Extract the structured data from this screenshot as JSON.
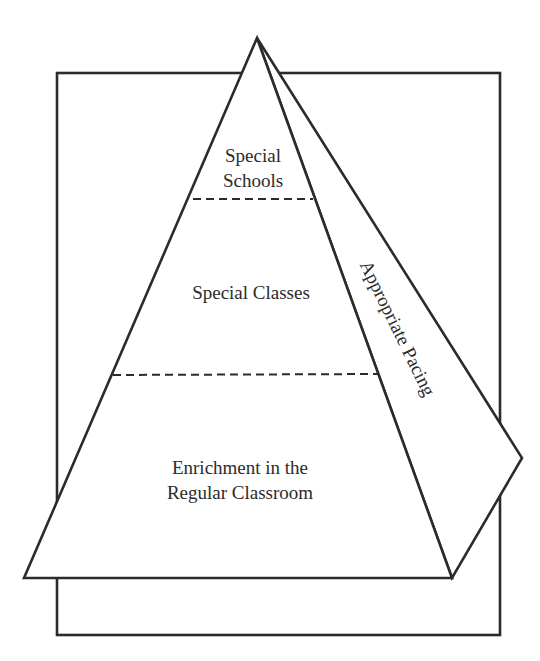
{
  "diagram": {
    "type": "pyramid",
    "levels": [
      {
        "id": "top",
        "lines": [
          "Special",
          "Schools"
        ]
      },
      {
        "id": "middle",
        "lines": [
          "Special Classes"
        ]
      },
      {
        "id": "base",
        "lines": [
          "Enrichment in the",
          "Regular Classroom"
        ]
      }
    ],
    "side_face_label": "Appropriate Pacing",
    "colors": {
      "line": "#2b2b2b",
      "background": "#ffffff"
    }
  }
}
